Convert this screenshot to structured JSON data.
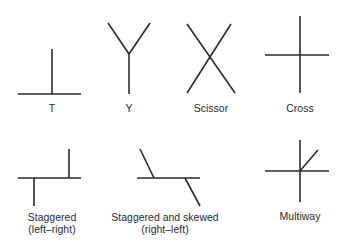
{
  "diagram": {
    "type": "intersection-types",
    "items": [
      {
        "id": "t",
        "label_lines": [
          "T"
        ]
      },
      {
        "id": "y",
        "label_lines": [
          "Y"
        ]
      },
      {
        "id": "scissor",
        "label_lines": [
          "Scissor"
        ]
      },
      {
        "id": "cross",
        "label_lines": [
          "Cross"
        ]
      },
      {
        "id": "staggered",
        "label_lines": [
          "Staggered",
          "(left–right)"
        ]
      },
      {
        "id": "staggered-skewed",
        "label_lines": [
          "Staggered and skewed",
          "(right–left)"
        ]
      },
      {
        "id": "multiway",
        "label_lines": [
          "Multiway"
        ]
      }
    ]
  }
}
